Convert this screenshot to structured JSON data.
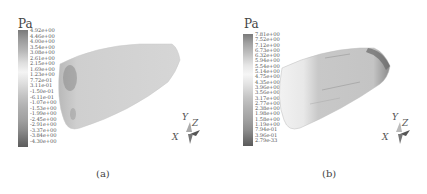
{
  "figure": {
    "panels": [
      {
        "id": "a",
        "caption": "(a)",
        "unit": "Pa",
        "legend_labels": [
          "4.92e+00",
          "4.46e+00",
          "4.00e+00",
          "3.54e+00",
          "3.08e+00",
          "2.61e+00",
          "2.15e+00",
          "1.69e+00",
          "1.23e+00",
          "7.72e-01",
          "3.11e-01",
          "-1.50e-01",
          "-6.11e-01",
          "-1.07e+00",
          "-1.53e+00",
          "-1.99e+00",
          "-2.45e+00",
          "-2.91e+00",
          "-3.37e+00",
          "-3.84e+00",
          "-4.30e+00"
        ],
        "axes": {
          "x": "X",
          "y": "Y",
          "z": "Z"
        }
      },
      {
        "id": "b",
        "caption": "(b)",
        "unit": "Pa",
        "legend_labels": [
          "7.81e+00",
          "7.52e+00",
          "7.12e+00",
          "6.73e+00",
          "6.32e+00",
          "5.94e+00",
          "5.54e+00",
          "5.14e+00",
          "4.75e+00",
          "4.35e+00",
          "3.96e+00",
          "3.56e+00",
          "3.17e+00",
          "2.77e+00",
          "2.38e+00",
          "1.98e+00",
          "1.58e+00",
          "1.19e+00",
          "7.94e-01",
          "3.96e-01",
          "2.79e-33"
        ],
        "axes": {
          "x": "X",
          "y": "Y",
          "z": "Z"
        }
      }
    ]
  }
}
